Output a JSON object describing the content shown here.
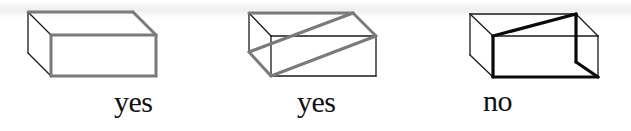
{
  "figure": {
    "colors": {
      "thin_edge": "#1a1a1a",
      "highlight_gray": "#7a7a7a",
      "highlight_black": "#0a0a0a",
      "background": "#ffffff"
    },
    "boxes": [
      {
        "id": "box-1",
        "label": "yes",
        "highlight_color": "gray",
        "thin_edges": [
          [
            28,
            12,
            51,
            35
          ],
          [
            28,
            12,
            28,
            53
          ],
          [
            28,
            53,
            51,
            76
          ]
        ],
        "highlight_edges": [
          [
            28,
            12,
            133,
            12
          ],
          [
            133,
            12,
            156,
            35
          ],
          [
            51,
            35,
            156,
            35
          ],
          [
            156,
            35,
            156,
            76
          ],
          [
            156,
            76,
            51,
            76
          ],
          [
            51,
            76,
            51,
            35
          ]
        ]
      },
      {
        "id": "box-2",
        "label": "yes",
        "highlight_color": "gray",
        "thin_edges": [
          [
            249,
            13,
            271,
            36
          ],
          [
            249,
            13,
            249,
            52
          ],
          [
            271,
            36,
            376,
            36
          ],
          [
            271,
            36,
            271,
            76
          ],
          [
            376,
            36,
            376,
            76
          ],
          [
            376,
            76,
            271,
            76
          ]
        ],
        "highlight_edges": [
          [
            249,
            13,
            353,
            13
          ],
          [
            353,
            13,
            376,
            36
          ],
          [
            376,
            36,
            271,
            76
          ],
          [
            271,
            76,
            249,
            52
          ],
          [
            249,
            52,
            353,
            13
          ]
        ]
      },
      {
        "id": "box-3",
        "label": "no",
        "highlight_color": "black",
        "thin_edges": [
          [
            470,
            14,
            576,
            14
          ],
          [
            470,
            14,
            493,
            36
          ],
          [
            470,
            14,
            470,
            55
          ],
          [
            470,
            55,
            493,
            77
          ],
          [
            576,
            14,
            598,
            36
          ],
          [
            493,
            36,
            598,
            36
          ],
          [
            598,
            36,
            598,
            77
          ]
        ],
        "highlight_edges": [
          [
            493,
            36,
            576,
            14
          ],
          [
            576,
            14,
            576,
            62
          ],
          [
            576,
            62,
            598,
            77
          ],
          [
            598,
            77,
            493,
            77
          ],
          [
            493,
            77,
            493,
            36
          ]
        ]
      }
    ]
  }
}
